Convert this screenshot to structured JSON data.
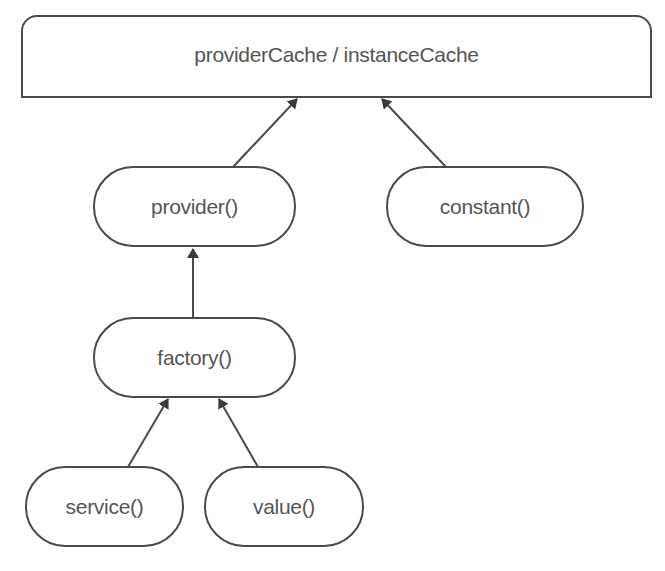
{
  "diagram": {
    "nodes": {
      "cache": {
        "label": "providerCache / instanceCache"
      },
      "provider": {
        "label": "provider()"
      },
      "constant": {
        "label": "constant()"
      },
      "factory": {
        "label": "factory()"
      },
      "service": {
        "label": "service()"
      },
      "value": {
        "label": "value()"
      }
    },
    "edges": [
      {
        "from": "provider",
        "to": "cache"
      },
      {
        "from": "constant",
        "to": "cache"
      },
      {
        "from": "factory",
        "to": "provider"
      },
      {
        "from": "service",
        "to": "factory"
      },
      {
        "from": "value",
        "to": "factory"
      }
    ],
    "colors": {
      "stroke": "#4a4a4a",
      "text": "#555555",
      "background": "#ffffff"
    }
  }
}
